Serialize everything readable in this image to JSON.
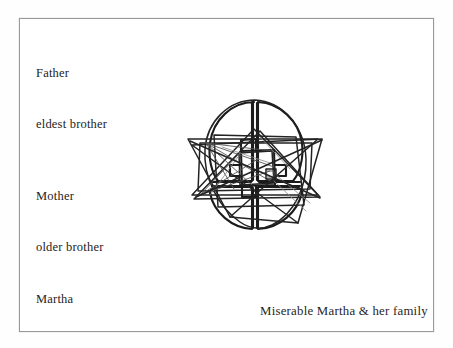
{
  "page": {
    "background_color": "#ffffff",
    "frame_border_color": "#9a9a9a"
  },
  "labels": {
    "father": {
      "line1": "Father",
      "line2": "eldest brother"
    },
    "mother": {
      "line1": "Mother",
      "line2": "older brother"
    },
    "martha": {
      "line1": "Martha"
    }
  },
  "caption": {
    "text": "Miserable Martha & her family"
  },
  "drawing": {
    "name": "family-sketch",
    "description": "hand-drawn oval divided into four quadrants with overlapping triangles and a small central square",
    "ink_color": "#1b1b1b"
  }
}
